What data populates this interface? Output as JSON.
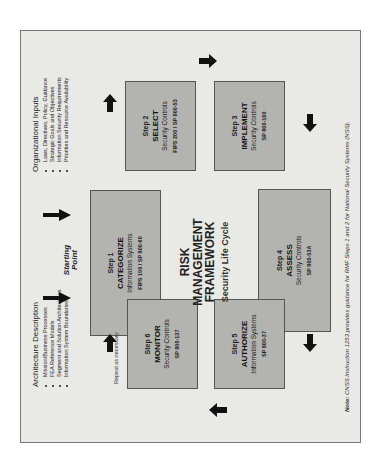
{
  "organizational_inputs": {
    "title": "Organizational Inputs",
    "items": [
      "Laws, Directives, Policy, Guidance",
      "Strategic Goals and Objectives",
      "Information Security Requirements",
      "Priorities and Resource Availability"
    ]
  },
  "architecture_description": {
    "title": "Architecture Description",
    "items": [
      "Mission/Business Processes",
      "FEA Reference Models",
      "Segment and Solution Architectures",
      "Information System Boundaries"
    ]
  },
  "starting_point": {
    "line1": "Starting",
    "line2": "Point"
  },
  "repeat_label": "Repeat as necessary",
  "center": {
    "line1": "RISK",
    "line2": "MANAGEMENT",
    "line3": "FRAMEWORK",
    "subtitle": "Security Life Cycle"
  },
  "steps": [
    {
      "step": "Step 1",
      "name": "CATEGORIZE",
      "sub": "Information Systems",
      "ref": "FIPS 199 / SP 800-60"
    },
    {
      "step": "Step 2",
      "name": "SELECT",
      "sub": "Security Controls",
      "ref": "FIPS 200 / SP 800-53"
    },
    {
      "step": "Step 3",
      "name": "IMPLEMENT",
      "sub": "Security Controls",
      "ref": "SP 800-160"
    },
    {
      "step": "Step 4",
      "name": "ASSESS",
      "sub": "Security Controls",
      "ref": "SP 800-53A"
    },
    {
      "step": "Step 5",
      "name": "AUTHORIZE",
      "sub": "Information Systems",
      "ref": "SP 800-37"
    },
    {
      "step": "Step 6",
      "name": "MONITOR",
      "sub": "Security Controls",
      "ref": "SP 800-137"
    }
  ],
  "note": {
    "label": "Note:",
    "text": "CNSS Instruction 1253 provides guidance for RMF Steps 1 and 2 for National Security Systems (NSS)."
  },
  "colors": {
    "background": "#e9e9e6",
    "box_fill": "#b3b3b0",
    "box_border": "#555555",
    "arrow": "#111111"
  }
}
